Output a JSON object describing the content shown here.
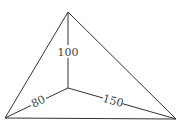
{
  "diagram": {
    "type": "triangle-with-interior-point",
    "colors": {
      "line": "#333333",
      "text": "#444444",
      "background": "#ffffff"
    },
    "vertices": {
      "top": {
        "x": 68,
        "y": 12
      },
      "bottom_left": {
        "x": 5,
        "y": 118
      },
      "bottom_right": {
        "x": 176,
        "y": 119
      },
      "interior": {
        "x": 68,
        "y": 88
      }
    },
    "labels": {
      "interior_to_top": "100",
      "interior_to_bottom_left": "80",
      "interior_to_bottom_right": "150"
    }
  }
}
